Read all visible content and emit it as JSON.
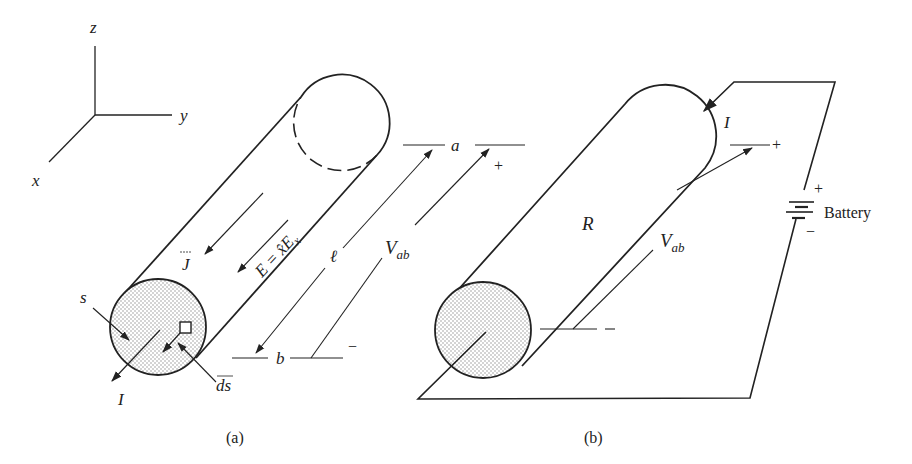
{
  "figure": {
    "axes": {
      "z_label": "z",
      "y_label": "y",
      "x_label": "x"
    },
    "panel_a": {
      "caption": "(a)",
      "current_density_label": "J",
      "field_label": "E = x̂E",
      "field_subscript": "x",
      "length_label": "ℓ",
      "voltage_label": "V",
      "voltage_subscript": "ab",
      "terminal_a": "a",
      "terminal_b": "b",
      "plus_sign": "+",
      "minus_sign": "−",
      "surface_label": "s",
      "area_element_label": "ds",
      "current_label": "I"
    },
    "panel_b": {
      "caption": "(b)",
      "resistance_label": "R",
      "current_label": "I",
      "voltage_label": "V",
      "voltage_subscript": "ab",
      "plus_sign": "+",
      "minus_sign": "−",
      "battery_label": "Battery",
      "battery_plus": "+",
      "battery_minus": "−"
    },
    "colors": {
      "ink": "#222222",
      "background": "#ffffff",
      "stipple": "#9a9a9a"
    }
  }
}
